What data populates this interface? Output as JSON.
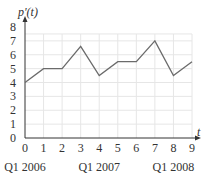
{
  "chart_data": {
    "type": "line",
    "title": "",
    "ylabel": "p'(t)",
    "xlabel": "t",
    "x": [
      0,
      1,
      2,
      3,
      4,
      5,
      6,
      7,
      8,
      9
    ],
    "series": [
      {
        "name": "p'(t)",
        "values": [
          4,
          5,
          5,
          6.6,
          4.5,
          5.5,
          5.5,
          7,
          4.5,
          5.5
        ]
      }
    ],
    "xlim": [
      0,
      9
    ],
    "ylim": [
      0,
      8
    ],
    "xticks": [
      "0",
      "1",
      "2",
      "3",
      "4",
      "5",
      "6",
      "7",
      "8",
      "9"
    ],
    "yticks": [
      "0",
      "1",
      "2",
      "3",
      "4",
      "5",
      "6",
      "7",
      "8"
    ],
    "category_labels": [
      {
        "at": 0,
        "label": "Q1 2006"
      },
      {
        "at": 4,
        "label": "Q1 2007"
      },
      {
        "at": 8,
        "label": "Q1 2008"
      }
    ],
    "grid": true,
    "legend": "none",
    "colors": {
      "line": "#6b6b6b",
      "grid": "#e6e6e6",
      "axis": "#333333"
    }
  }
}
